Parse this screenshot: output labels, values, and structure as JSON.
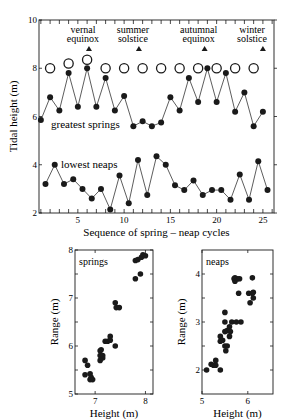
{
  "chart_data": [
    {
      "type": "line",
      "title": "",
      "xlabel": "Sequence of spring – neap cycles",
      "ylabel": "Tidal height (m)",
      "xlim": [
        0.8,
        26.2
      ],
      "ylim": [
        2,
        10
      ],
      "xticks": [
        5,
        10,
        15,
        20,
        25
      ],
      "yticks": [
        2,
        4,
        6,
        8,
        10
      ],
      "grid": false,
      "series": [
        {
          "name": "greatest springs",
          "marker": "filled-circle",
          "x": [
            1,
            2,
            3,
            4,
            5,
            6,
            7,
            8,
            9,
            10,
            11,
            12,
            13,
            14,
            15,
            16,
            17,
            18,
            19,
            20,
            21,
            22,
            23,
            24,
            25
          ],
          "values": [
            5.85,
            6.8,
            6.25,
            7.8,
            6.4,
            8.0,
            6.4,
            7.6,
            6.25,
            6.85,
            5.6,
            5.8,
            5.6,
            5.75,
            6.8,
            6.25,
            7.6,
            6.6,
            8.0,
            6.6,
            7.8,
            6.2,
            7.0,
            5.6,
            6.2
          ]
        },
        {
          "name": "lowest neaps",
          "marker": "filled-circle",
          "x": [
            1.5,
            2.5,
            3.5,
            4.5,
            5.5,
            6.5,
            7.5,
            8.5,
            9.5,
            10.5,
            11.5,
            12.5,
            13.5,
            14.5,
            15.5,
            16.5,
            17.5,
            18.5,
            19.5,
            20.5,
            21.5,
            22.5,
            23.5,
            24.5,
            25.5
          ],
          "values": [
            3.2,
            4.0,
            3.2,
            3.4,
            3.0,
            2.6,
            3.0,
            2.15,
            3.55,
            2.4,
            4.2,
            2.75,
            4.35,
            4.0,
            3.15,
            2.95,
            3.35,
            2.75,
            2.95,
            2.95,
            2.55,
            3.6,
            2.55,
            4.15,
            2.95
          ]
        },
        {
          "name": "open circles",
          "marker": "open-circle",
          "x": [
            2,
            4,
            6,
            8,
            10,
            12,
            14,
            16,
            18,
            20,
            22,
            24
          ],
          "values": [
            8.0,
            8.2,
            8.35,
            8.0,
            8.0,
            8.0,
            8.0,
            8.0,
            8.0,
            8.0,
            8.0,
            8.0
          ]
        }
      ],
      "annotations": [
        {
          "text": [
            "vernal",
            "equinox"
          ],
          "x": 6.2,
          "marker_y": 8.8
        },
        {
          "text": [
            "summer",
            "solstice"
          ],
          "x": 11.6,
          "marker_y": 8.8
        },
        {
          "text": [
            "autumnal",
            "equinox"
          ],
          "x": 18.7,
          "marker_y": 8.8
        },
        {
          "text": [
            "winter",
            "solstice"
          ],
          "x": 25.0,
          "marker_y": 8.8
        }
      ]
    },
    {
      "type": "scatter",
      "title": "springs",
      "xlabel": "Height (m)",
      "ylabel": "Range (m)",
      "xlim": [
        6.6,
        8.15
      ],
      "ylim": [
        5,
        8
      ],
      "xticks": [
        7,
        8
      ],
      "yticks": [
        5,
        6,
        7,
        8
      ],
      "x": [
        6.8,
        6.8,
        6.85,
        6.9,
        6.9,
        6.92,
        6.95,
        7.1,
        7.1,
        7.1,
        7.12,
        7.15,
        7.15,
        7.2,
        7.25,
        7.3,
        7.3,
        7.4,
        7.4,
        7.42,
        7.48,
        7.8,
        7.8,
        7.85,
        7.9,
        7.92,
        7.95,
        8.0
      ],
      "values": [
        5.7,
        5.4,
        5.6,
        5.3,
        5.42,
        5.35,
        5.3,
        5.9,
        5.8,
        5.7,
        5.92,
        5.75,
        5.8,
        6.1,
        6.1,
        6.2,
        6.12,
        6.0,
        6.9,
        6.8,
        6.8,
        7.4,
        7.78,
        7.8,
        7.5,
        7.85,
        7.9,
        7.88
      ]
    },
    {
      "type": "scatter",
      "title": "neaps",
      "xlabel": "Height (m)",
      "ylabel": "Range (m)",
      "xlim": [
        5,
        6.55
      ],
      "ylim": [
        1.5,
        4.5
      ],
      "xticks": [
        5,
        6
      ],
      "yticks": [
        2,
        3,
        4
      ],
      "x": [
        5.1,
        5.2,
        5.25,
        5.3,
        5.3,
        5.4,
        5.4,
        5.4,
        5.45,
        5.5,
        5.5,
        5.5,
        5.5,
        5.52,
        5.55,
        5.55,
        5.6,
        5.6,
        5.62,
        5.65,
        5.7,
        5.72,
        5.72,
        5.75,
        5.78,
        5.8,
        5.82,
        5.85,
        6.02,
        6.05,
        6.1,
        6.1,
        6.12,
        6.12
      ],
      "values": [
        2.0,
        2.12,
        2.1,
        2.2,
        2.1,
        2.0,
        2.7,
        2.6,
        2.62,
        3.2,
        3.0,
        2.8,
        2.5,
        2.4,
        2.82,
        2.5,
        2.9,
        2.7,
        2.8,
        3.0,
        3.9,
        3.85,
        3.92,
        3.0,
        3.9,
        3.6,
        3.9,
        3.0,
        3.6,
        3.4,
        3.92,
        3.6,
        3.5,
        3.62
      ]
    }
  ],
  "labels": {
    "top_ylabel": "Tidal height (m)",
    "top_xlabel": "Sequence of spring – neap cycles",
    "series_springs": "greatest springs",
    "series_neaps": "lowest neaps",
    "springs_panel_title": "springs",
    "neaps_panel_title": "neaps",
    "bottom_ylabel": "Range (m)",
    "bottom_xlabel": "Height (m)"
  }
}
